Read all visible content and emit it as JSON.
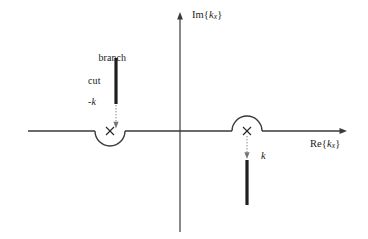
{
  "figure": {
    "name": "complex-kx-plane-contour",
    "background_color": "#ffffff",
    "ink_color": "#262626",
    "width": 368,
    "height": 239
  },
  "axes": {
    "imaginary": {
      "label_prefix": "Im{",
      "label_var": "k",
      "label_sub": "x",
      "label_suffix": "}",
      "label_text": "Im{k_x}",
      "orientation": "vertical",
      "x": 180,
      "y_top": 14,
      "y_bottom": 232,
      "arrow_at": "top"
    },
    "real": {
      "label_prefix": "Re{",
      "label_var": "k",
      "label_sub": "x",
      "label_suffix": "}",
      "label_text": "Re{k_x}",
      "orientation": "horizontal",
      "y": 131,
      "x_left": 28,
      "x_right": 347,
      "arrow_at": "right"
    }
  },
  "poles": [
    {
      "id": "pole-negative-k",
      "marker": "x",
      "label": "-k",
      "x": 110,
      "y": 131,
      "detour": "below",
      "detour_radius": 15
    },
    {
      "id": "pole-positive-k",
      "marker": "x",
      "label": "k",
      "x": 247,
      "y": 131,
      "detour": "above",
      "detour_radius": 15
    }
  ],
  "branch_cuts": [
    {
      "id": "branch-cut-upper",
      "annotation_line1": "branch",
      "annotation_line2": "cut",
      "annotation_text": "branch cut",
      "x": 116,
      "y_start": 58,
      "y_end": 104,
      "pointer": {
        "style": "dotted-arrow",
        "from_y": 104,
        "to_y": 128,
        "direction": "down",
        "target": "pole-negative-k"
      }
    },
    {
      "id": "branch-cut-lower",
      "x": 247,
      "y_start": 160,
      "y_end": 205,
      "pointer": {
        "style": "dotted-arrow",
        "from_y": 136,
        "to_y": 158,
        "direction": "down",
        "target": "branch-cut-lower"
      }
    }
  ],
  "labels": {
    "branch_cut_line1": "branch",
    "branch_cut_line2": "cut",
    "negative_k": "-k",
    "positive_k": "k"
  }
}
